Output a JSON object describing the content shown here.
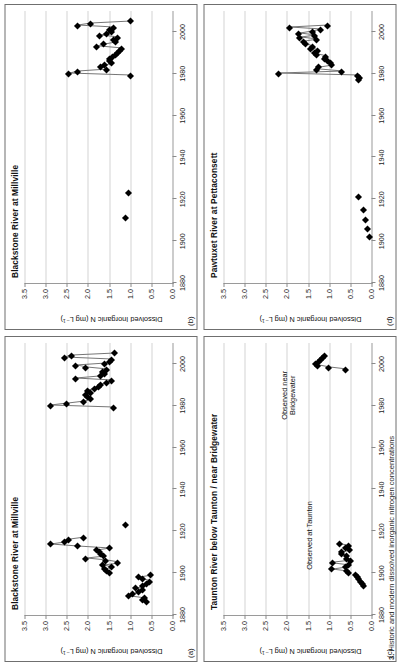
{
  "figure": {
    "caption_number": "3.",
    "caption_text": "Historic and modern dissolved inorganic nitrogen concentrations",
    "axis_title": "Dissolved Inorganic N (mg L⁻¹)",
    "y_ticks": [
      "3.5",
      "3.0",
      "2.5",
      "2.0",
      "1.5",
      "1.0",
      "0.5",
      "0.0"
    ],
    "y_values": [
      3.5,
      3.0,
      2.5,
      2.0,
      1.5,
      1.0,
      0.5,
      0.0
    ],
    "x_ticks": [
      "1880",
      "1900",
      "1920",
      "1940",
      "1960",
      "1980",
      "2000"
    ],
    "x_values": [
      1880,
      1900,
      1920,
      1940,
      1960,
      1980,
      2000
    ],
    "marker_color": "#000000",
    "line_color": "#777777",
    "grid_color": "#d4d4d4",
    "axis_color": "#9a9a9a"
  },
  "chart_data": [
    {
      "type": "scatter",
      "panel": "a",
      "title": "Blackstone River at Millville",
      "xlabel": "",
      "ylabel": "Dissolved Inorganic N (mg L⁻¹)",
      "xlim": [
        1880,
        2010
      ],
      "ylim": [
        0.0,
        3.5
      ],
      "grid": true,
      "annotations": [],
      "points": [
        {
          "x": 1886,
          "y": 0.62
        },
        {
          "x": 1887,
          "y": 0.7
        },
        {
          "x": 1888,
          "y": 0.66
        },
        {
          "x": 1889,
          "y": 1.05
        },
        {
          "x": 1890,
          "y": 0.95
        },
        {
          "x": 1891,
          "y": 0.8
        },
        {
          "x": 1892,
          "y": 0.72
        },
        {
          "x": 1893,
          "y": 0.88
        },
        {
          "x": 1894,
          "y": 0.7
        },
        {
          "x": 1895,
          "y": 0.62
        },
        {
          "x": 1896,
          "y": 0.55
        },
        {
          "x": 1897,
          "y": 0.72
        },
        {
          "x": 1898,
          "y": 0.8
        },
        {
          "x": 1899,
          "y": 0.52
        },
        {
          "x": 1900,
          "y": 1.5
        },
        {
          "x": 1901,
          "y": 1.55
        },
        {
          "x": 1902,
          "y": 1.6
        },
        {
          "x": 1903,
          "y": 1.45
        },
        {
          "x": 1904,
          "y": 1.65
        },
        {
          "x": 1905,
          "y": 1.3
        },
        {
          "x": 1906,
          "y": 1.58
        },
        {
          "x": 1907,
          "y": 2.05
        },
        {
          "x": 1908,
          "y": 1.62
        },
        {
          "x": 1909,
          "y": 1.7
        },
        {
          "x": 1910,
          "y": 1.72
        },
        {
          "x": 1911,
          "y": 1.8
        },
        {
          "x": 1912,
          "y": 1.5
        },
        {
          "x": 1913,
          "y": 2.25
        },
        {
          "x": 1914,
          "y": 2.88
        },
        {
          "x": 1915,
          "y": 2.55
        },
        {
          "x": 1916,
          "y": 2.45
        },
        {
          "x": 1917,
          "y": 2.1
        },
        {
          "x": 1923,
          "y": 1.1
        },
        {
          "x": 1979,
          "y": 1.4
        },
        {
          "x": 1980,
          "y": 2.88
        },
        {
          "x": 1981,
          "y": 2.5
        },
        {
          "x": 1982,
          "y": 2.1
        },
        {
          "x": 1983,
          "y": 1.95
        },
        {
          "x": 1984,
          "y": 2.0
        },
        {
          "x": 1985,
          "y": 2.05
        },
        {
          "x": 1986,
          "y": 1.95
        },
        {
          "x": 1987,
          "y": 2.0
        },
        {
          "x": 1988,
          "y": 1.85
        },
        {
          "x": 1989,
          "y": 1.75
        },
        {
          "x": 1990,
          "y": 1.7
        },
        {
          "x": 1991,
          "y": 1.55
        },
        {
          "x": 1992,
          "y": 1.45
        },
        {
          "x": 1993,
          "y": 2.3
        },
        {
          "x": 1994,
          "y": 1.7
        },
        {
          "x": 1995,
          "y": 1.6
        },
        {
          "x": 1996,
          "y": 1.65
        },
        {
          "x": 1997,
          "y": 1.55
        },
        {
          "x": 1998,
          "y": 2.05
        },
        {
          "x": 1999,
          "y": 2.3
        },
        {
          "x": 2000,
          "y": 1.6
        },
        {
          "x": 2001,
          "y": 1.5
        },
        {
          "x": 2002,
          "y": 1.45
        },
        {
          "x": 2003,
          "y": 2.55
        },
        {
          "x": 2004,
          "y": 2.4
        },
        {
          "x": 2005,
          "y": 1.38
        }
      ],
      "connected_runs": [
        [
          1886,
          1887,
          1888,
          1889,
          1890,
          1891,
          1892,
          1893,
          1894,
          1895,
          1896,
          1897,
          1898,
          1899
        ],
        [
          1900,
          1901,
          1902,
          1903,
          1904,
          1905,
          1906,
          1907,
          1908,
          1909,
          1910,
          1911,
          1912,
          1913,
          1914,
          1915,
          1916,
          1917
        ],
        [
          1979,
          1980,
          1981,
          1982,
          1983,
          1984,
          1985,
          1986,
          1987,
          1988,
          1989,
          1990,
          1991,
          1992,
          1993,
          1994,
          1995,
          1996,
          1997,
          1998,
          1999,
          2000,
          2001,
          2002,
          2003,
          2004,
          2005
        ]
      ]
    },
    {
      "type": "scatter",
      "panel": "b",
      "title": "Blackstone River at Millville",
      "xlabel": "",
      "ylabel": "Dissolved Inorganic N (mg L⁻¹)",
      "xlim": [
        1880,
        2010
      ],
      "ylim": [
        0.0,
        3.5
      ],
      "grid": true,
      "annotations": [],
      "points": [
        {
          "x": 1911,
          "y": 1.1
        },
        {
          "x": 1923,
          "y": 1.05
        },
        {
          "x": 1979,
          "y": 1.0
        },
        {
          "x": 1980,
          "y": 2.45
        },
        {
          "x": 1981,
          "y": 2.25
        },
        {
          "x": 1982,
          "y": 1.55
        },
        {
          "x": 1983,
          "y": 1.7
        },
        {
          "x": 1984,
          "y": 1.6
        },
        {
          "x": 1985,
          "y": 1.45
        },
        {
          "x": 1986,
          "y": 1.5
        },
        {
          "x": 1987,
          "y": 1.48
        },
        {
          "x": 1988,
          "y": 1.42
        },
        {
          "x": 1989,
          "y": 1.35
        },
        {
          "x": 1990,
          "y": 1.3
        },
        {
          "x": 1991,
          "y": 1.25
        },
        {
          "x": 1992,
          "y": 1.2
        },
        {
          "x": 1993,
          "y": 1.8
        },
        {
          "x": 1994,
          "y": 1.62
        },
        {
          "x": 1995,
          "y": 1.35
        },
        {
          "x": 1996,
          "y": 1.4
        },
        {
          "x": 1997,
          "y": 1.3
        },
        {
          "x": 1998,
          "y": 1.72
        },
        {
          "x": 1999,
          "y": 1.55
        },
        {
          "x": 2000,
          "y": 1.45
        },
        {
          "x": 2001,
          "y": 1.5
        },
        {
          "x": 2002,
          "y": 1.4
        },
        {
          "x": 2003,
          "y": 2.25
        },
        {
          "x": 2004,
          "y": 1.95
        },
        {
          "x": 2005,
          "y": 1.0
        }
      ],
      "connected_runs": [
        [
          1979,
          1980,
          1981,
          1982,
          1983,
          1984,
          1985,
          1986,
          1987,
          1988,
          1989,
          1990,
          1991,
          1992,
          1993,
          1994,
          1995,
          1996,
          1997,
          1998,
          1999,
          2000,
          2001,
          2002,
          2003,
          2004,
          2005
        ]
      ]
    },
    {
      "type": "scatter",
      "panel": "c",
      "title": "Taunton River below Taunton / near Bridgewater",
      "xlabel": "",
      "ylabel": "Dissolved Inorganic N (mg L⁻¹)",
      "xlim": [
        1880,
        2010
      ],
      "ylim": [
        0.0,
        3.5
      ],
      "grid": true,
      "annotations": [
        {
          "text": "Observed at Taunton",
          "x": 1918,
          "y": 1.45
        },
        {
          "text": "Observed near\nBridgewater",
          "x": 1985,
          "y": 1.95
        }
      ],
      "points": [
        {
          "x": 1894,
          "y": 0.18
        },
        {
          "x": 1895,
          "y": 0.22
        },
        {
          "x": 1896,
          "y": 0.26
        },
        {
          "x": 1897,
          "y": 0.3
        },
        {
          "x": 1898,
          "y": 0.34
        },
        {
          "x": 1899,
          "y": 0.38
        },
        {
          "x": 1900,
          "y": 0.55
        },
        {
          "x": 1901,
          "y": 0.58
        },
        {
          "x": 1902,
          "y": 0.95
        },
        {
          "x": 1903,
          "y": 0.62
        },
        {
          "x": 1904,
          "y": 0.55
        },
        {
          "x": 1905,
          "y": 0.92
        },
        {
          "x": 1906,
          "y": 0.5
        },
        {
          "x": 1907,
          "y": 0.6
        },
        {
          "x": 1908,
          "y": 0.58
        },
        {
          "x": 1909,
          "y": 0.72
        },
        {
          "x": 1910,
          "y": 0.7
        },
        {
          "x": 1911,
          "y": 0.52
        },
        {
          "x": 1912,
          "y": 0.62
        },
        {
          "x": 1913,
          "y": 0.55
        },
        {
          "x": 1914,
          "y": 0.75
        },
        {
          "x": 1997,
          "y": 0.62
        },
        {
          "x": 1998,
          "y": 1.02
        },
        {
          "x": 1999,
          "y": 1.28
        },
        {
          "x": 2000,
          "y": 1.32
        },
        {
          "x": 2001,
          "y": 1.25
        },
        {
          "x": 2002,
          "y": 1.2
        },
        {
          "x": 2003,
          "y": 1.15
        },
        {
          "x": 2004,
          "y": 1.1
        }
      ],
      "connected_runs": [
        [
          1894,
          1895,
          1896,
          1897,
          1898,
          1899
        ],
        [
          1900,
          1901,
          1902,
          1903,
          1904,
          1905,
          1906,
          1907,
          1908,
          1909,
          1910,
          1911,
          1912,
          1913,
          1914
        ],
        [
          1997,
          1998,
          1999,
          2000,
          2001,
          2002,
          2003,
          2004
        ]
      ]
    },
    {
      "type": "scatter",
      "panel": "d",
      "title": "Pawtuxet River at Pettaconsett",
      "xlabel": "",
      "ylabel": "Dissolved Inorganic N (mg L⁻¹)",
      "xlim": [
        1880,
        2010
      ],
      "ylim": [
        0.0,
        3.5
      ],
      "grid": true,
      "annotations": [],
      "points": [
        {
          "x": 1902,
          "y": 0.05
        },
        {
          "x": 1906,
          "y": 0.1
        },
        {
          "x": 1910,
          "y": 0.14
        },
        {
          "x": 1915,
          "y": 0.18
        },
        {
          "x": 1921,
          "y": 0.3
        },
        {
          "x": 1977,
          "y": 0.3
        },
        {
          "x": 1978,
          "y": 0.28
        },
        {
          "x": 1979,
          "y": 0.32
        },
        {
          "x": 1980,
          "y": 2.2
        },
        {
          "x": 1981,
          "y": 0.7
        },
        {
          "x": 1982,
          "y": 1.3
        },
        {
          "x": 1983,
          "y": 1.25
        },
        {
          "x": 1984,
          "y": 0.95
        },
        {
          "x": 1985,
          "y": 0.98
        },
        {
          "x": 1986,
          "y": 1.05
        },
        {
          "x": 1987,
          "y": 1.1
        },
        {
          "x": 1988,
          "y": 1.08
        },
        {
          "x": 1989,
          "y": 1.3
        },
        {
          "x": 1990,
          "y": 1.35
        },
        {
          "x": 1991,
          "y": 1.28
        },
        {
          "x": 1992,
          "y": 1.45
        },
        {
          "x": 1993,
          "y": 1.4
        },
        {
          "x": 1994,
          "y": 1.55
        },
        {
          "x": 1995,
          "y": 1.6
        },
        {
          "x": 1996,
          "y": 1.3
        },
        {
          "x": 1997,
          "y": 1.7
        },
        {
          "x": 1998,
          "y": 1.35
        },
        {
          "x": 1999,
          "y": 1.72
        },
        {
          "x": 2000,
          "y": 1.4
        },
        {
          "x": 2001,
          "y": 1.2
        },
        {
          "x": 2002,
          "y": 1.95
        },
        {
          "x": 2003,
          "y": 1.05
        }
      ],
      "connected_runs": [
        [
          1977,
          1978,
          1979,
          1980,
          1981,
          1982,
          1983,
          1984,
          1985,
          1986,
          1987,
          1988,
          1989,
          1990,
          1991,
          1992,
          1993,
          1994,
          1995,
          1996,
          1997,
          1998,
          1999,
          2000,
          2001,
          2002,
          2003
        ]
      ]
    }
  ]
}
